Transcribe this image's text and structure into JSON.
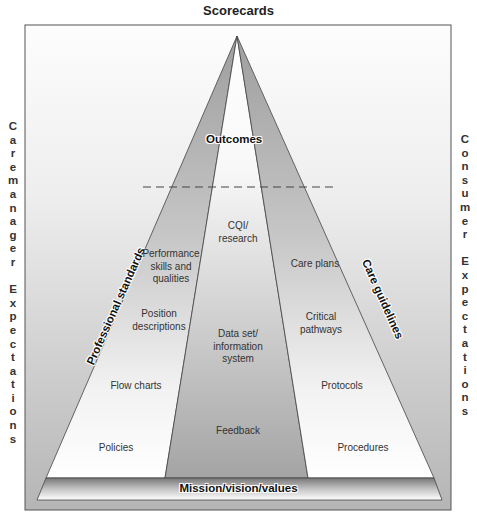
{
  "diagram": {
    "title": "Scorecards",
    "left_side": {
      "label": "Caremanager Expectations",
      "letters": [
        "C",
        "a",
        "r",
        "e",
        "m",
        "a",
        "n",
        "a",
        "g",
        "e",
        "r",
        "",
        "E",
        "x",
        "p",
        "e",
        "c",
        "t",
        "a",
        "t",
        "i",
        "o",
        "n",
        "s"
      ]
    },
    "right_side": {
      "label": "Consumer Expectations",
      "letters": [
        "C",
        "o",
        "n",
        "s",
        "u",
        "m",
        "e",
        "r",
        "",
        "E",
        "x",
        "p",
        "e",
        "c",
        "t",
        "a",
        "t",
        "i",
        "o",
        "n",
        "s"
      ]
    },
    "apex_label": "Outcomes",
    "base_label": "Mission/vision/values",
    "left_band": {
      "title": "Professional standards",
      "items": [
        "Performance skills and qualities",
        "Position descriptions",
        "Flow charts",
        "Policies"
      ]
    },
    "center_band": {
      "items": [
        "CQI/ research",
        "Data set/ information system",
        "Feedback"
      ]
    },
    "right_band": {
      "title": "Care guidelines",
      "items": [
        "Care plans",
        "Critical pathways",
        "Protocols",
        "Procedures"
      ]
    },
    "colors": {
      "band_gray": "#a8a8a8",
      "band_light": "#ffffff",
      "frame_bottom": "#b8b8b8",
      "outline": "#444444"
    }
  }
}
